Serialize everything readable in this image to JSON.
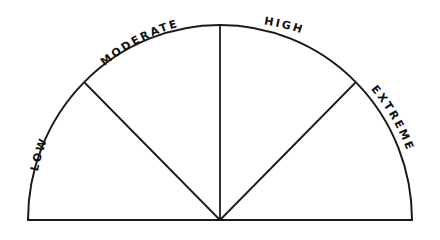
{
  "diagram": {
    "type": "semicircle-gauge",
    "segments": [
      {
        "label": "LOW"
      },
      {
        "label": "MODERATE"
      },
      {
        "label": "HIGH"
      },
      {
        "label": "EXTREME"
      }
    ],
    "colors": {
      "stroke": "#1a1a1a",
      "fill": "#ffffff",
      "text": "#111111"
    }
  }
}
